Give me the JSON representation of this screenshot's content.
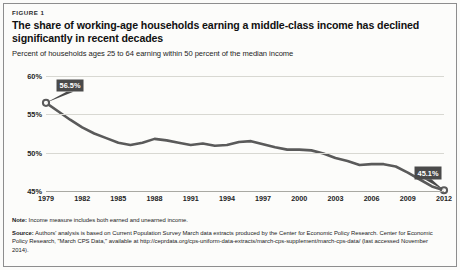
{
  "figure": {
    "number_label": "FIGURE 1",
    "headline": "The share of working-age households earning a middle-class income has declined significantly in recent decades",
    "subhead": "Percent of households ages 25 to 64 earning within 50 percent of the median income"
  },
  "notes": {
    "note_label": "Note:",
    "note_text": "Income measure includes both earned and unearned income.",
    "source_label": "Source:",
    "source_text": "Authors' analysis is based on Current Population Survey March data extracts produced by the Center for Economic Policy Research. Center for Economic Policy Research, \"March CPS Data,\" available at http://ceprdata.org/cps-uniform-data-extracts/march-cps-supplement/march-cps-data/  (last accessed November 2014)."
  },
  "colors": {
    "line": "#5a5a5a",
    "callout_bg": "#4a4a4a",
    "callout_text": "#ffffff",
    "grid": "#d8d8d2",
    "frame": "#8d8d8d",
    "background": "#fcfcfa"
  },
  "chart_data": {
    "type": "line",
    "title": "The share of working-age households earning a middle-class income has declined significantly in recent decades",
    "subtitle": "Percent of households ages 25 to 64 earning within 50 percent of the median income",
    "xlabel": "",
    "ylabel": "",
    "ylim": [
      45,
      60
    ],
    "xlim": [
      1979,
      2012
    ],
    "ytick_values": [
      60,
      55,
      50,
      45
    ],
    "ytick_labels": [
      "60%",
      "55%",
      "50%",
      "45%"
    ],
    "xtick_labels": [
      "1979",
      "1982",
      "1985",
      "1988",
      "1991",
      "1994",
      "1997",
      "2000",
      "2003",
      "2006",
      "2009",
      "2012"
    ],
    "grid": true,
    "legend": "none",
    "x": [
      1979,
      1980,
      1981,
      1982,
      1983,
      1984,
      1985,
      1986,
      1987,
      1988,
      1989,
      1990,
      1991,
      1992,
      1993,
      1994,
      1995,
      1996,
      1997,
      1998,
      1999,
      2000,
      2001,
      2002,
      2003,
      2004,
      2005,
      2006,
      2007,
      2008,
      2009,
      2010,
      2011,
      2012
    ],
    "values": [
      56.5,
      55.4,
      54.3,
      53.3,
      52.5,
      51.9,
      51.3,
      51.0,
      51.3,
      51.8,
      51.6,
      51.3,
      51.0,
      51.2,
      50.9,
      51.0,
      51.4,
      51.5,
      51.1,
      50.7,
      50.4,
      50.4,
      50.3,
      49.9,
      49.3,
      48.9,
      48.4,
      48.5,
      48.5,
      48.2,
      47.4,
      46.5,
      45.6,
      45.1
    ],
    "annotations": [
      {
        "label": "56.5%",
        "x": 1979,
        "y": 56.5,
        "marker": "open-circle"
      },
      {
        "label": "45.1%",
        "x": 2012,
        "y": 45.1,
        "marker": "open-circle"
      }
    ]
  }
}
